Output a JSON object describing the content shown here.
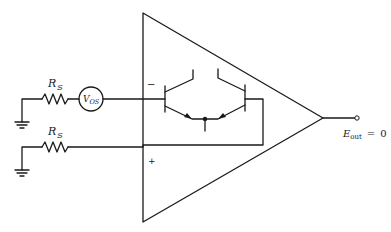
{
  "diagram": {
    "type": "circuit-schematic",
    "components": {
      "rs_top": {
        "label_main": "R",
        "label_sub": "S"
      },
      "vos_source": {
        "label_main": "V",
        "label_sub": "OS"
      },
      "rs_bottom": {
        "label_main": "R",
        "label_sub": "S"
      },
      "inverting_input": {
        "symbol": "−"
      },
      "noninverting_input": {
        "symbol": "+"
      },
      "output": {
        "label_main": "E",
        "label_sub": "out",
        "relation": "=",
        "value": "0"
      }
    }
  }
}
